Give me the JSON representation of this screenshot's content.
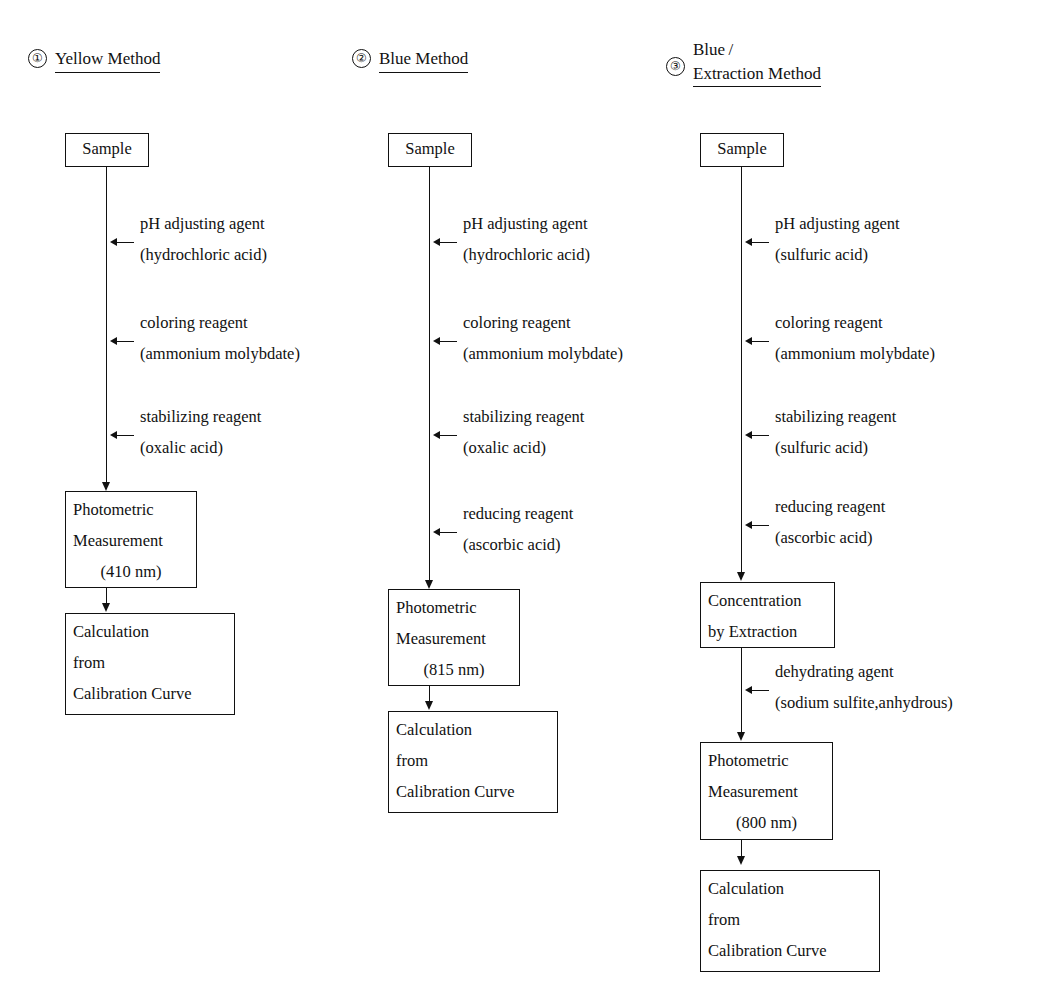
{
  "diagram": {
    "columns": [
      {
        "number": "①",
        "header_line1": "Yellow Method",
        "header_line2": "",
        "start_node": "Sample",
        "reagents": [
          {
            "name": "pH adjusting agent",
            "detail": "(hydrochloric acid)"
          },
          {
            "name": "coloring reagent",
            "detail": "(ammonium molybdate)"
          },
          {
            "name": "stabilizing reagent",
            "detail": "(oxalic acid)"
          }
        ],
        "measure_node": [
          "Photometric",
          "Measurement",
          "(410 nm)"
        ],
        "result_node": [
          "Calculation",
          "from",
          "Calibration Curve"
        ]
      },
      {
        "number": "②",
        "header_line1": "Blue Method",
        "header_line2": "",
        "start_node": "Sample",
        "reagents": [
          {
            "name": "pH adjusting agent",
            "detail": "(hydrochloric acid)"
          },
          {
            "name": "coloring reagent",
            "detail": "(ammonium molybdate)"
          },
          {
            "name": "stabilizing reagent",
            "detail": "(oxalic acid)"
          },
          {
            "name": "reducing reagent",
            "detail": "(ascorbic acid)"
          }
        ],
        "measure_node": [
          "Photometric",
          "Measurement",
          "(815 nm)"
        ],
        "result_node": [
          "Calculation",
          "from",
          "Calibration Curve"
        ]
      },
      {
        "number": "③",
        "header_line1": "Blue /",
        "header_line2": "Extraction Method",
        "start_node": "Sample",
        "reagents": [
          {
            "name": "pH adjusting agent",
            "detail": "(sulfuric acid)"
          },
          {
            "name": "coloring reagent",
            "detail": "(ammonium molybdate)"
          },
          {
            "name": "stabilizing reagent",
            "detail": "(sulfuric acid)"
          },
          {
            "name": "reducing reagent",
            "detail": "(ascorbic acid)"
          }
        ],
        "extraction_node": [
          "Concentration",
          "by Extraction"
        ],
        "post_extraction_reagents": [
          {
            "name": "dehydrating agent",
            "detail": "(sodium sulfite,anhydrous)"
          }
        ],
        "measure_node": [
          "Photometric",
          "Measurement",
          "(800 nm)"
        ],
        "result_node": [
          "Calculation",
          "from",
          "Calibration Curve"
        ]
      }
    ]
  }
}
